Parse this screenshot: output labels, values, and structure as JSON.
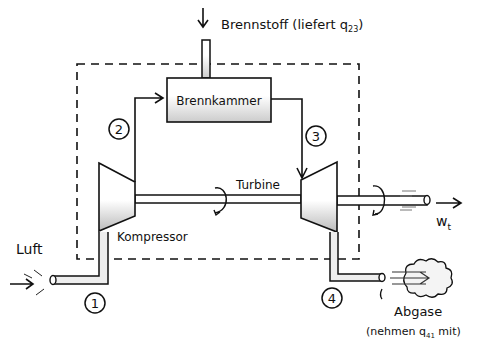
{
  "diagram": {
    "labels": {
      "fuel": "Brennstoff (liefert q",
      "fuel_sub": "23",
      "fuel_end": ")",
      "combustion_chamber": "Brennkammer",
      "turbine": "Turbine",
      "compressor": "Kompressor",
      "air": "Luft",
      "work": "w",
      "work_sub": "t",
      "exhaust": "Abgase",
      "exhaust_note": "(nehmen q",
      "exhaust_note_sub": "41",
      "exhaust_note_end": " mit)"
    },
    "states": [
      "1",
      "2",
      "3",
      "4"
    ],
    "colors": {
      "ink": "#111111",
      "shade": "#bdbdbd",
      "background": "#ffffff"
    }
  }
}
